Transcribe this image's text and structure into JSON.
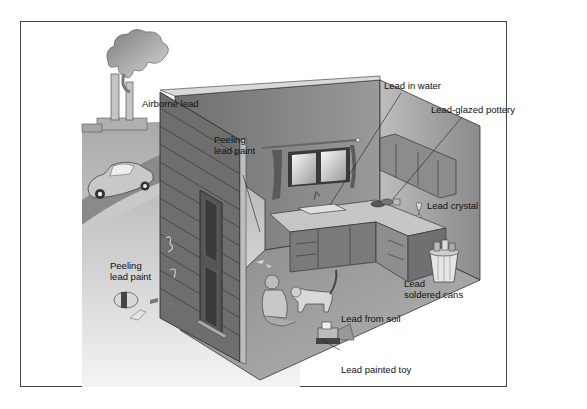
{
  "diagram": {
    "colors": {
      "frame": "#444444",
      "ground": "#b8b8b8",
      "road": "#8a8a8a",
      "wall_dark": "#7a7a7a",
      "wall_light": "#a8a8a8",
      "floor": "#9c9c9c",
      "siding": "#6e6e6e",
      "smoke": "#9a9a9a",
      "text": "#111111"
    },
    "labels": {
      "airborne_lead": "Airborne lead",
      "peeling_paint_inside": [
        "Peeling",
        "lead paint"
      ],
      "lead_in_water": "Lead in water",
      "lead_glazed_pottery": "Lead-glazed pottery",
      "lead_crystal": "Lead crystal",
      "peeling_paint_outside": [
        "Peeling",
        "lead paint"
      ],
      "lead_soldered_cans": [
        "Lead",
        "soldered cans"
      ],
      "lead_from_soil": "Lead from soil",
      "lead_painted_toy": "Lead painted toy"
    },
    "elements": [
      "factory-smokestacks",
      "car",
      "house-exterior-wall",
      "door",
      "kitchen-window",
      "sink",
      "upper-cabinets",
      "lower-cabinets",
      "pottery-dishes",
      "crystal-glass",
      "trash-can-with-cans",
      "child",
      "cat",
      "toy-truck",
      "paint-bucket"
    ]
  }
}
